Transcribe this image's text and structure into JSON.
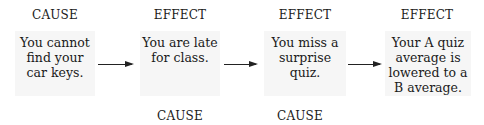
{
  "diagram": {
    "nodes": [
      {
        "top_label": "CAUSE",
        "text": "You cannot find your car keys.",
        "lines": [
          "You cannot",
          "find your",
          "car keys."
        ]
      },
      {
        "top_label": "EFFECT",
        "bottom_label": "CAUSE",
        "lines": [
          "You are late",
          "for class."
        ]
      },
      {
        "top_label": "EFFECT",
        "bottom_label": "CAUSE",
        "lines": [
          "You miss a",
          "surprise quiz."
        ]
      },
      {
        "top_label": "EFFECT",
        "lines": [
          "Your A quiz",
          "average is",
          "lowered to a",
          "B average."
        ]
      }
    ],
    "arrows": [
      "node0->node1",
      "node1->node2",
      "node2->node3"
    ]
  }
}
